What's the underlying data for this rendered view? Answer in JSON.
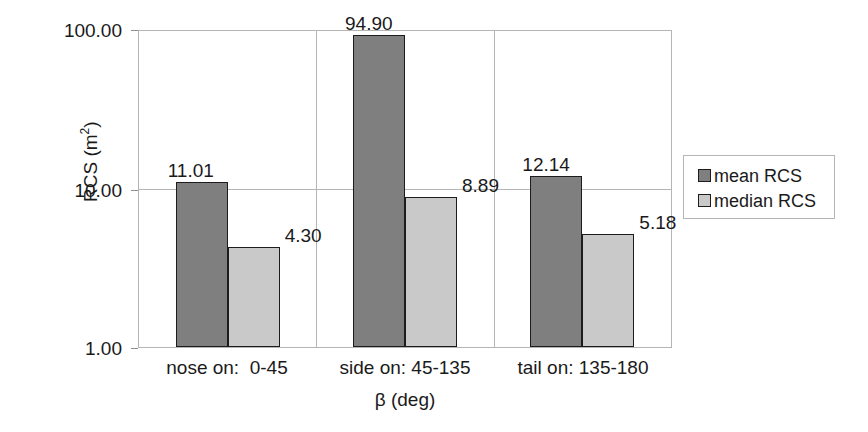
{
  "chart_data": {
    "type": "bar",
    "title": "",
    "xlabel": "β (deg)",
    "ylabel": "RCS (m²)",
    "ylabel_base": "RCS (m",
    "ylabel_sup": "2",
    "ylabel_tail": ")",
    "yscale": "log",
    "ylim": [
      1.0,
      100.0
    ],
    "grid": true,
    "legend_position": "right",
    "categories": [
      "nose on:  0-45",
      "side on: 45-135",
      "tail on: 135-180"
    ],
    "y_tick_labels": [
      "100.00",
      "10.00",
      "1.00"
    ],
    "y_tick_values": [
      100.0,
      10.0,
      1.0
    ],
    "series": [
      {
        "name": "mean RCS",
        "color": "#7f7f7f",
        "values": [
          11.01,
          94.9,
          12.14
        ],
        "labels": [
          "11.01",
          "94.90",
          "12.14"
        ]
      },
      {
        "name": "median RCS",
        "color": "#c9c9c9",
        "values": [
          4.3,
          8.89,
          5.18
        ],
        "labels": [
          "4.30",
          "8.89",
          "5.18"
        ]
      }
    ]
  },
  "legend": {
    "items": [
      {
        "label": "mean RCS"
      },
      {
        "label": "median RCS"
      }
    ]
  },
  "axes": {
    "y_title": "RCS (m",
    "y_title_sup": "2",
    "y_title_end": ")",
    "x_title": "β (deg)"
  }
}
